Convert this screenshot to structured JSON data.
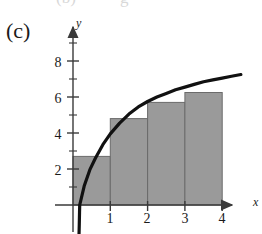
{
  "figure": {
    "panel_label": "(c)",
    "axes": {
      "x_name": "x",
      "y_name": "y",
      "x_tick_labels": [
        "1",
        "2",
        "3",
        "4"
      ],
      "y_tick_labels": [
        "2",
        "4",
        "6",
        "8"
      ]
    },
    "colors": {
      "bar_fill": "#9a9a9a",
      "bar_stroke": "#6b6b6b",
      "curve": "#111111",
      "axis": "#3a3a3a",
      "text": "#1a1a1a",
      "background": "#ffffff"
    }
  },
  "chart_data": {
    "type": "bar",
    "title": "(c)",
    "xlabel": "x",
    "ylabel": "y",
    "xlim": [
      0,
      4.6
    ],
    "ylim": [
      0,
      9.2
    ],
    "grid": false,
    "legend": null,
    "x_ticks": [
      1,
      2,
      3,
      4
    ],
    "y_ticks": [
      2,
      4,
      6,
      8
    ],
    "y_minor_ticks": [
      1,
      3,
      5,
      7,
      9
    ],
    "categories": [
      "0-1",
      "1-2",
      "2-3",
      "3-4"
    ],
    "values": [
      2.7,
      4.8,
      5.7,
      6.25
    ],
    "bar_width": 1,
    "bar_left_edges": [
      0,
      1,
      2,
      3
    ],
    "series": [
      {
        "name": "right-endpoint rectangles",
        "values": [
          2.7,
          4.8,
          5.7,
          6.25
        ]
      },
      {
        "name": "curve",
        "type": "line",
        "x": [
          0.18,
          0.3,
          0.45,
          0.6,
          0.8,
          1.0,
          1.25,
          1.5,
          1.75,
          2.0,
          2.25,
          2.5,
          2.75,
          3.0,
          3.25,
          3.5,
          3.75,
          4.0,
          4.25,
          4.5
        ],
        "y": [
          0.0,
          1.05,
          1.95,
          2.6,
          3.35,
          3.95,
          4.55,
          5.05,
          5.45,
          5.75,
          6.0,
          6.2,
          6.4,
          6.55,
          6.7,
          6.85,
          6.95,
          7.05,
          7.15,
          7.25
        ]
      }
    ]
  }
}
